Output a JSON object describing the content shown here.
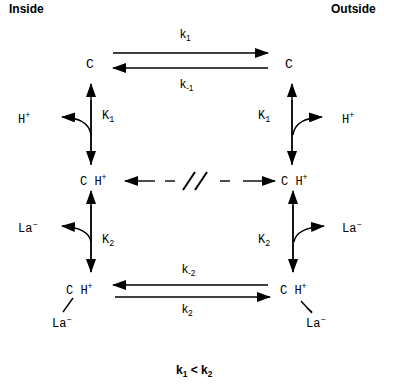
{
  "header": {
    "inside_label": "Inside",
    "outside_label": "Outside"
  },
  "states": {
    "c_inside": "C",
    "c_outside": "C",
    "ch_inside": "C H",
    "ch_outside": "C H",
    "chla_inside_top": "C H",
    "chla_inside_la": "La",
    "chla_outside_top": "C H",
    "chla_outside_la": "La"
  },
  "species": {
    "proton": "H",
    "proton_charge": "+",
    "lactate": "La",
    "lactate_charge": "−"
  },
  "rate_constants": {
    "k1": {
      "base": "k",
      "sub": "1"
    },
    "k_minus1": {
      "base": "k",
      "sub": "-1"
    },
    "k2": {
      "base": "k",
      "sub": "2"
    },
    "k_minus2": {
      "base": "k",
      "sub": "-2"
    }
  },
  "equilibrium_constants": {
    "K1": {
      "base": "K",
      "sub": "1"
    },
    "K2": {
      "base": "K",
      "sub": "2"
    }
  },
  "footer": {
    "relation_left": {
      "base": "k",
      "sub": "1"
    },
    "relation_op": "<",
    "relation_right": {
      "base": "k",
      "sub": "2"
    }
  }
}
